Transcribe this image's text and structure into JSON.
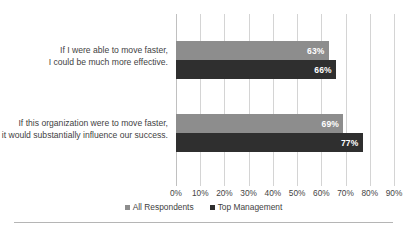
{
  "chart_data": {
    "type": "bar",
    "orientation": "horizontal",
    "title": "",
    "xlabel": "",
    "ylabel": "",
    "xlim": [
      0,
      90
    ],
    "grid": true,
    "legend_position": "bottom",
    "categories": [
      "If I were able to move faster, I could be much more effective.",
      "If this organization were to move faster, it would substantially influence our success."
    ],
    "category_lines": [
      [
        "If I were able to move faster,",
        "I could be much more effective."
      ],
      [
        "If this organization were to move faster,",
        "it would substantially influence our success."
      ]
    ],
    "series": [
      {
        "name": "All Respondents",
        "color": "#8d8d8d",
        "values": [
          63,
          69
        ],
        "labels": [
          "63%",
          "69%"
        ]
      },
      {
        "name": "Top Management",
        "color": "#2f2f2f",
        "values": [
          66,
          77
        ],
        "labels": [
          "66%",
          "77%"
        ]
      }
    ],
    "xticks": [
      0,
      10,
      20,
      30,
      40,
      50,
      60,
      70,
      80,
      90
    ],
    "xtick_labels": [
      "0%",
      "10%",
      "20%",
      "30%",
      "40%",
      "50%",
      "60%",
      "70%",
      "80%",
      "90%"
    ]
  },
  "colors": {
    "series_all_respondents": "#8d8d8d",
    "series_top_management": "#2f2f2f",
    "gridline": "#d4d4d4",
    "text": "#3f3f3f",
    "rule": "#b5b5b5",
    "background": "#ffffff"
  }
}
